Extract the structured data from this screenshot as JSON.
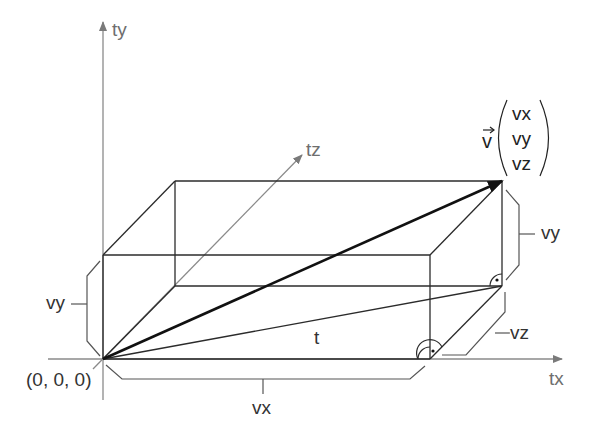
{
  "diagram": {
    "type": "3d-vector-decomposition",
    "axes": {
      "x": {
        "label": "tx"
      },
      "y": {
        "label": "ty"
      },
      "z": {
        "label": "tz"
      }
    },
    "origin_label": "(0, 0, 0)",
    "vector": {
      "name": "v",
      "components": [
        "vx",
        "vy",
        "vz"
      ]
    },
    "dimension_labels": {
      "left_height": "vy",
      "right_height": "vy",
      "bottom_width": "vx",
      "depth": "vz",
      "diagonal": "t"
    },
    "colors": {
      "axis": "#7a7a7a",
      "box_edge": "#2b2b2b",
      "vector": "#111111",
      "bracket": "#555555"
    }
  }
}
